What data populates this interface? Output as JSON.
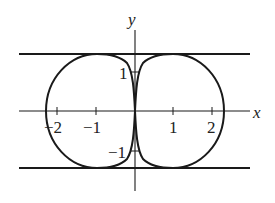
{
  "figure": {
    "x_axis_label": "x",
    "y_axis_label": "y",
    "x_ticks": [
      {
        "value": -2,
        "label": "−2"
      },
      {
        "value": -1,
        "label": "−1"
      },
      {
        "value": 1,
        "label": "1"
      },
      {
        "value": 2,
        "label": "2"
      }
    ],
    "y_ticks": [
      {
        "value": 1,
        "label": "1"
      },
      {
        "value": -1,
        "label": "−1"
      }
    ],
    "asymptotes": [
      {
        "type": "horizontal",
        "y": 1.45
      },
      {
        "type": "horizontal",
        "y": -1.45
      }
    ],
    "curve": "two closed lobes symmetric about the y-axis, meeting in a cusp at the origin, tangent to the horizontal lines",
    "line_color": "#1a1a1a"
  }
}
